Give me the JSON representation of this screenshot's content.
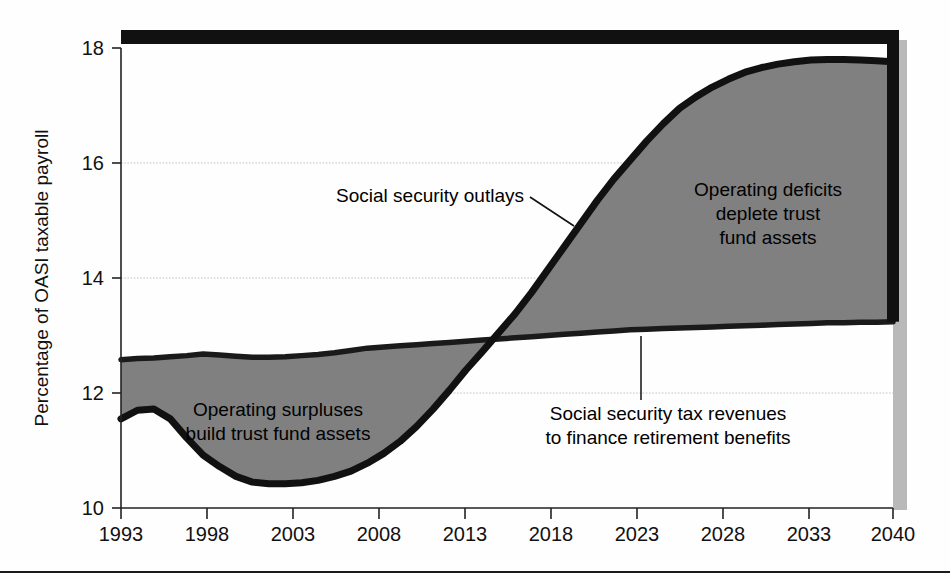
{
  "figure": {
    "background_color": "#fefefe",
    "plot_area_color": "#ffffff",
    "fill_color": "#808080",
    "outlays_line_color": "#111111",
    "revenue_line_color": "#1a1a1a",
    "shadow_color": "#b8b8b8",
    "gridline_color": "#bdbdbd",
    "axis_color": "#222222",
    "rule_color": "#1a1a1a"
  },
  "axes": {
    "ylabel": "Percentage of OASI taxable payroll",
    "xlabel": "",
    "y_ticks": [
      "10",
      "12",
      "14",
      "16",
      "18"
    ],
    "x_ticks": [
      "1993",
      "1998",
      "2003",
      "2008",
      "2013",
      "2018",
      "2023",
      "2028",
      "2033",
      "2040"
    ]
  },
  "annotations": {
    "outlays": {
      "label": "Social security outlays"
    },
    "surpluses": {
      "line1": "Operating surpluses",
      "line2": "build trust fund assets"
    },
    "deficits": {
      "line1": "Operating deficits",
      "line2": "deplete trust",
      "line3": "fund assets"
    },
    "revenues": {
      "line1": "Social security tax revenues",
      "line2": "to finance retirement benefits"
    }
  },
  "chart_data": {
    "type": "area",
    "title": "",
    "subtitle": "",
    "xlabel": "",
    "ylabel": "Percentage of OASI taxable payroll",
    "xlim": [
      1993,
      2040
    ],
    "ylim": [
      10,
      18
    ],
    "y_tick_values": [
      10,
      12,
      14,
      16,
      18
    ],
    "x_tick_values": [
      1993,
      1998,
      2003,
      2008,
      2013,
      2018,
      2023,
      2028,
      2033,
      2040
    ],
    "grid": "horizontal-dotted",
    "legend": "none (inline annotations)",
    "annotation_positions": {
      "social_security_outlays_leader_from": [
        2033,
        15.25
      ],
      "social_security_tax_revenues_leader_from": [
        2024,
        12.9
      ]
    },
    "x": [
      1993,
      1994,
      1995,
      1996,
      1997,
      1998,
      1999,
      2000,
      2001,
      2002,
      2003,
      2004,
      2005,
      2006,
      2007,
      2008,
      2009,
      2010,
      2011,
      2012,
      2013,
      2014,
      2015,
      2016,
      2017,
      2018,
      2019,
      2020,
      2021,
      2022,
      2023,
      2024,
      2025,
      2026,
      2027,
      2028,
      2029,
      2030,
      2031,
      2032,
      2033,
      2034,
      2035,
      2036,
      2037,
      2038,
      2039,
      2040
    ],
    "series": [
      {
        "name": "Social security outlays",
        "style": "thick black line, lower boundary early / upper boundary later",
        "values": [
          11.55,
          11.7,
          11.72,
          11.55,
          11.22,
          10.92,
          10.72,
          10.55,
          10.45,
          10.42,
          10.42,
          10.44,
          10.48,
          10.55,
          10.64,
          10.78,
          10.95,
          11.16,
          11.42,
          11.72,
          12.05,
          12.4,
          12.72,
          13.05,
          13.38,
          13.75,
          14.15,
          14.55,
          14.95,
          15.35,
          15.72,
          16.05,
          16.38,
          16.68,
          16.95,
          17.15,
          17.32,
          17.46,
          17.58,
          17.66,
          17.72,
          17.76,
          17.79,
          17.8,
          17.8,
          17.79,
          17.78,
          17.76
        ]
      },
      {
        "name": "Social security tax revenues",
        "style": "thick dark line, upper boundary early / lower boundary later",
        "values": [
          12.58,
          12.6,
          12.61,
          12.63,
          12.65,
          12.68,
          12.66,
          12.64,
          12.62,
          12.62,
          12.63,
          12.65,
          12.67,
          12.7,
          12.74,
          12.78,
          12.8,
          12.82,
          12.84,
          12.86,
          12.88,
          12.9,
          12.92,
          12.94,
          12.96,
          12.98,
          13.0,
          13.02,
          13.04,
          13.06,
          13.08,
          13.1,
          13.11,
          13.12,
          13.13,
          13.14,
          13.15,
          13.16,
          13.17,
          13.18,
          13.19,
          13.2,
          13.21,
          13.22,
          13.22,
          13.23,
          13.23,
          13.24
        ]
      }
    ],
    "regions": [
      {
        "label": "Operating surpluses build trust fund assets",
        "from": 1993,
        "to": 2016,
        "meaning": "revenues above outlays"
      },
      {
        "label": "Operating deficits deplete trust fund assets",
        "from": 2016,
        "to": 2040,
        "meaning": "outlays above revenues"
      }
    ]
  }
}
